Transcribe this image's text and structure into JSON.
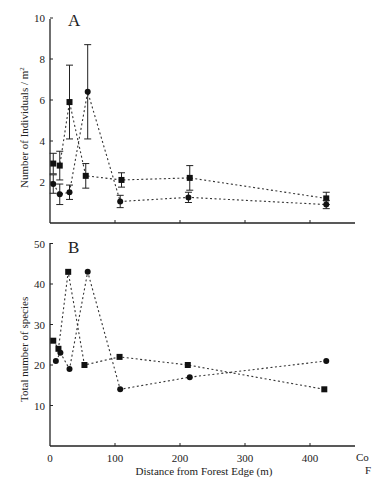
{
  "chart_data": [
    {
      "type": "line",
      "panel_label": "A",
      "title": "",
      "xlabel": "",
      "ylabel": "Number of Individuals / m²",
      "ylim": [
        0,
        10
      ],
      "xlim": [
        0,
        440
      ],
      "yticks": [
        "2",
        "4",
        "6",
        "8",
        "10"
      ],
      "xticks": [
        100,
        200,
        300,
        400
      ],
      "grid": false,
      "error_bars": true,
      "series": [
        {
          "name": "squares",
          "marker": "square",
          "x": [
            5,
            15,
            30,
            55,
            110,
            215,
            425
          ],
          "y": [
            2.9,
            2.8,
            5.9,
            2.3,
            2.1,
            2.2,
            1.2
          ],
          "err": [
            0.5,
            0.7,
            1.8,
            0.6,
            0.35,
            0.6,
            0.3
          ]
        },
        {
          "name": "circles",
          "marker": "circle",
          "x": [
            5,
            15,
            30,
            58,
            108,
            213,
            425
          ],
          "y": [
            1.9,
            1.4,
            1.5,
            6.4,
            1.05,
            1.25,
            0.9
          ],
          "err": [
            0.45,
            0.5,
            0.35,
            2.3,
            0.3,
            0.25,
            0.2
          ]
        }
      ]
    },
    {
      "type": "line",
      "panel_label": "B",
      "title": "",
      "xlabel": "Distance from Forest Edge (m)",
      "ylabel": "Total number of species",
      "ylim": [
        0,
        50
      ],
      "xlim": [
        0,
        440
      ],
      "yticks": [
        "10",
        "20",
        "30",
        "40",
        "50"
      ],
      "xticks": [
        "0",
        "100",
        "200",
        "300",
        "400"
      ],
      "extra_xtick_label": "Co",
      "extra_xtick_label2": "F",
      "grid": false,
      "series": [
        {
          "name": "squares",
          "marker": "square",
          "x": [
            5,
            13,
            28,
            53,
            107,
            212,
            422
          ],
          "y": [
            26,
            24,
            43,
            20,
            22,
            20,
            14
          ]
        },
        {
          "name": "circles",
          "marker": "circle",
          "x": [
            9,
            16,
            30,
            58,
            108,
            215,
            425
          ],
          "y": [
            21,
            23,
            19,
            43,
            14,
            17,
            21
          ]
        }
      ]
    }
  ],
  "labels": {
    "panel_a": "A",
    "panel_b": "B",
    "ylabel_a": "Number of Individuals / m",
    "ylabel_a_sup": "2",
    "ylabel_b": "Total number of species",
    "xlabel": "Distance from Forest Edge (m)",
    "cut_label_1": "Co",
    "cut_label_2": "F"
  }
}
